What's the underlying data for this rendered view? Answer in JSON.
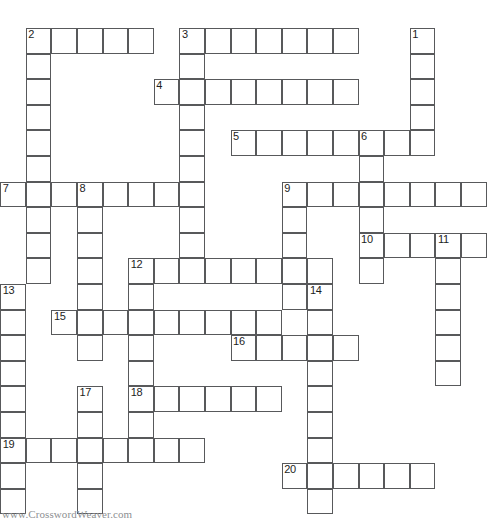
{
  "puzzle": {
    "title": "Crossword Puzzle Grid",
    "watermark": "www.CrosswordWeaver.com",
    "cell_size": 25.6,
    "origin_x": 0.2,
    "origin_y": 28.0,
    "colors": {
      "cell_border": "#58595b",
      "cell_fill": "#ffffff",
      "number_text": "#1d1d1d",
      "watermark_text": "#8d8f92",
      "page_background": "#ffffff"
    },
    "entries": [
      {
        "number": "1",
        "direction": "down",
        "row": 0,
        "col": 16,
        "length": 6
      },
      {
        "number": "2",
        "direction": "across",
        "row": 0,
        "col": 1,
        "length": 5
      },
      {
        "number": "2",
        "direction": "down",
        "row": 0,
        "col": 1,
        "length": 9
      },
      {
        "number": "3",
        "direction": "across",
        "row": 0,
        "col": 7,
        "length": 7
      },
      {
        "number": "3",
        "direction": "down",
        "row": 0,
        "col": 7,
        "length": 9
      },
      {
        "number": "4",
        "direction": "across",
        "row": 2,
        "col": 6,
        "length": 8
      },
      {
        "number": "5",
        "direction": "across",
        "row": 4,
        "col": 9,
        "length": 8
      },
      {
        "number": "6",
        "direction": "down",
        "row": 4,
        "col": 14,
        "length": 7
      },
      {
        "number": "7",
        "direction": "across",
        "row": 6,
        "col": 0,
        "length": 8
      },
      {
        "number": "8",
        "direction": "down",
        "row": 6,
        "col": 3,
        "length": 6
      },
      {
        "number": "9",
        "direction": "across",
        "row": 6,
        "col": 11,
        "length": 8
      },
      {
        "number": "9",
        "direction": "down",
        "row": 6,
        "col": 11,
        "length": 6
      },
      {
        "number": "10",
        "direction": "across",
        "row": 8,
        "col": 14,
        "length": 5
      },
      {
        "number": "11",
        "direction": "down",
        "row": 8,
        "col": 17,
        "length": 6
      },
      {
        "number": "12",
        "direction": "across",
        "row": 9,
        "col": 5,
        "length": 8
      },
      {
        "number": "12",
        "direction": "down",
        "row": 9,
        "col": 5,
        "length": 7
      },
      {
        "number": "13",
        "direction": "down",
        "row": 10,
        "col": 0,
        "length": 9
      },
      {
        "number": "14",
        "direction": "down",
        "row": 10,
        "col": 12,
        "length": 9
      },
      {
        "number": "15",
        "direction": "across",
        "row": 11,
        "col": 2,
        "length": 9
      },
      {
        "number": "16",
        "direction": "across",
        "row": 12,
        "col": 9,
        "length": 5
      },
      {
        "number": "17",
        "direction": "down",
        "row": 14,
        "col": 3,
        "length": 6
      },
      {
        "number": "18",
        "direction": "across",
        "row": 14,
        "col": 5,
        "length": 6
      },
      {
        "number": "19",
        "direction": "across",
        "row": 16,
        "col": 0,
        "length": 8
      },
      {
        "number": "20",
        "direction": "across",
        "row": 17,
        "col": 11,
        "length": 6
      }
    ],
    "cells": [
      {
        "r": 0,
        "c": 1,
        "n": "2"
      },
      {
        "r": 0,
        "c": 2,
        "n": ""
      },
      {
        "r": 0,
        "c": 3,
        "n": ""
      },
      {
        "r": 0,
        "c": 4,
        "n": ""
      },
      {
        "r": 0,
        "c": 5,
        "n": ""
      },
      {
        "r": 0,
        "c": 7,
        "n": "3"
      },
      {
        "r": 0,
        "c": 8,
        "n": ""
      },
      {
        "r": 0,
        "c": 9,
        "n": ""
      },
      {
        "r": 0,
        "c": 10,
        "n": ""
      },
      {
        "r": 0,
        "c": 11,
        "n": ""
      },
      {
        "r": 0,
        "c": 12,
        "n": ""
      },
      {
        "r": 0,
        "c": 13,
        "n": ""
      },
      {
        "r": 0,
        "c": 16,
        "n": "1"
      },
      {
        "r": 1,
        "c": 1,
        "n": ""
      },
      {
        "r": 1,
        "c": 7,
        "n": ""
      },
      {
        "r": 1,
        "c": 16,
        "n": ""
      },
      {
        "r": 2,
        "c": 1,
        "n": ""
      },
      {
        "r": 2,
        "c": 6,
        "n": "4"
      },
      {
        "r": 2,
        "c": 7,
        "n": ""
      },
      {
        "r": 2,
        "c": 8,
        "n": ""
      },
      {
        "r": 2,
        "c": 9,
        "n": ""
      },
      {
        "r": 2,
        "c": 10,
        "n": ""
      },
      {
        "r": 2,
        "c": 11,
        "n": ""
      },
      {
        "r": 2,
        "c": 12,
        "n": ""
      },
      {
        "r": 2,
        "c": 13,
        "n": ""
      },
      {
        "r": 2,
        "c": 16,
        "n": ""
      },
      {
        "r": 3,
        "c": 1,
        "n": ""
      },
      {
        "r": 3,
        "c": 7,
        "n": ""
      },
      {
        "r": 3,
        "c": 16,
        "n": ""
      },
      {
        "r": 4,
        "c": 1,
        "n": ""
      },
      {
        "r": 4,
        "c": 7,
        "n": ""
      },
      {
        "r": 4,
        "c": 9,
        "n": "5"
      },
      {
        "r": 4,
        "c": 10,
        "n": ""
      },
      {
        "r": 4,
        "c": 11,
        "n": ""
      },
      {
        "r": 4,
        "c": 12,
        "n": ""
      },
      {
        "r": 4,
        "c": 13,
        "n": ""
      },
      {
        "r": 4,
        "c": 14,
        "n": "6"
      },
      {
        "r": 4,
        "c": 15,
        "n": ""
      },
      {
        "r": 4,
        "c": 16,
        "n": ""
      },
      {
        "r": 5,
        "c": 1,
        "n": ""
      },
      {
        "r": 5,
        "c": 7,
        "n": ""
      },
      {
        "r": 5,
        "c": 14,
        "n": ""
      },
      {
        "r": 6,
        "c": 0,
        "n": "7"
      },
      {
        "r": 6,
        "c": 1,
        "n": ""
      },
      {
        "r": 6,
        "c": 2,
        "n": ""
      },
      {
        "r": 6,
        "c": 3,
        "n": "8"
      },
      {
        "r": 6,
        "c": 4,
        "n": ""
      },
      {
        "r": 6,
        "c": 5,
        "n": ""
      },
      {
        "r": 6,
        "c": 6,
        "n": ""
      },
      {
        "r": 6,
        "c": 7,
        "n": ""
      },
      {
        "r": 6,
        "c": 11,
        "n": "9"
      },
      {
        "r": 6,
        "c": 12,
        "n": ""
      },
      {
        "r": 6,
        "c": 13,
        "n": ""
      },
      {
        "r": 6,
        "c": 14,
        "n": ""
      },
      {
        "r": 6,
        "c": 15,
        "n": ""
      },
      {
        "r": 6,
        "c": 16,
        "n": ""
      },
      {
        "r": 6,
        "c": 17,
        "n": ""
      },
      {
        "r": 6,
        "c": 18,
        "n": ""
      },
      {
        "r": 7,
        "c": 1,
        "n": ""
      },
      {
        "r": 7,
        "c": 3,
        "n": ""
      },
      {
        "r": 7,
        "c": 7,
        "n": ""
      },
      {
        "r": 7,
        "c": 11,
        "n": ""
      },
      {
        "r": 7,
        "c": 14,
        "n": ""
      },
      {
        "r": 8,
        "c": 1,
        "n": ""
      },
      {
        "r": 8,
        "c": 3,
        "n": ""
      },
      {
        "r": 8,
        "c": 7,
        "n": ""
      },
      {
        "r": 8,
        "c": 11,
        "n": ""
      },
      {
        "r": 8,
        "c": 14,
        "n": "10"
      },
      {
        "r": 8,
        "c": 15,
        "n": ""
      },
      {
        "r": 8,
        "c": 16,
        "n": ""
      },
      {
        "r": 8,
        "c": 17,
        "n": "11"
      },
      {
        "r": 8,
        "c": 18,
        "n": ""
      },
      {
        "r": 9,
        "c": 1,
        "n": ""
      },
      {
        "r": 9,
        "c": 3,
        "n": ""
      },
      {
        "r": 9,
        "c": 5,
        "n": "12"
      },
      {
        "r": 9,
        "c": 6,
        "n": ""
      },
      {
        "r": 9,
        "c": 7,
        "n": ""
      },
      {
        "r": 9,
        "c": 8,
        "n": ""
      },
      {
        "r": 9,
        "c": 9,
        "n": ""
      },
      {
        "r": 9,
        "c": 10,
        "n": ""
      },
      {
        "r": 9,
        "c": 11,
        "n": ""
      },
      {
        "r": 9,
        "c": 12,
        "n": ""
      },
      {
        "r": 9,
        "c": 14,
        "n": ""
      },
      {
        "r": 9,
        "c": 17,
        "n": ""
      },
      {
        "r": 10,
        "c": 0,
        "n": "13"
      },
      {
        "r": 10,
        "c": 3,
        "n": ""
      },
      {
        "r": 10,
        "c": 5,
        "n": ""
      },
      {
        "r": 10,
        "c": 11,
        "n": ""
      },
      {
        "r": 10,
        "c": 12,
        "n": "14"
      },
      {
        "r": 10,
        "c": 17,
        "n": ""
      },
      {
        "r": 11,
        "c": 0,
        "n": ""
      },
      {
        "r": 11,
        "c": 2,
        "n": "15"
      },
      {
        "r": 11,
        "c": 3,
        "n": ""
      },
      {
        "r": 11,
        "c": 4,
        "n": ""
      },
      {
        "r": 11,
        "c": 5,
        "n": ""
      },
      {
        "r": 11,
        "c": 6,
        "n": ""
      },
      {
        "r": 11,
        "c": 7,
        "n": ""
      },
      {
        "r": 11,
        "c": 8,
        "n": ""
      },
      {
        "r": 11,
        "c": 9,
        "n": ""
      },
      {
        "r": 11,
        "c": 10,
        "n": ""
      },
      {
        "r": 11,
        "c": 12,
        "n": ""
      },
      {
        "r": 11,
        "c": 17,
        "n": ""
      },
      {
        "r": 12,
        "c": 0,
        "n": ""
      },
      {
        "r": 12,
        "c": 3,
        "n": ""
      },
      {
        "r": 12,
        "c": 5,
        "n": ""
      },
      {
        "r": 12,
        "c": 9,
        "n": "16"
      },
      {
        "r": 12,
        "c": 10,
        "n": ""
      },
      {
        "r": 12,
        "c": 11,
        "n": ""
      },
      {
        "r": 12,
        "c": 12,
        "n": ""
      },
      {
        "r": 12,
        "c": 13,
        "n": ""
      },
      {
        "r": 12,
        "c": 17,
        "n": ""
      },
      {
        "r": 13,
        "c": 0,
        "n": ""
      },
      {
        "r": 13,
        "c": 5,
        "n": ""
      },
      {
        "r": 13,
        "c": 12,
        "n": ""
      },
      {
        "r": 13,
        "c": 17,
        "n": ""
      },
      {
        "r": 14,
        "c": 0,
        "n": ""
      },
      {
        "r": 14,
        "c": 3,
        "n": "17"
      },
      {
        "r": 14,
        "c": 5,
        "n": "18"
      },
      {
        "r": 14,
        "c": 6,
        "n": ""
      },
      {
        "r": 14,
        "c": 7,
        "n": ""
      },
      {
        "r": 14,
        "c": 8,
        "n": ""
      },
      {
        "r": 14,
        "c": 9,
        "n": ""
      },
      {
        "r": 14,
        "c": 10,
        "n": ""
      },
      {
        "r": 14,
        "c": 12,
        "n": ""
      },
      {
        "r": 15,
        "c": 0,
        "n": ""
      },
      {
        "r": 15,
        "c": 3,
        "n": ""
      },
      {
        "r": 15,
        "c": 5,
        "n": ""
      },
      {
        "r": 15,
        "c": 12,
        "n": ""
      },
      {
        "r": 16,
        "c": 0,
        "n": "19"
      },
      {
        "r": 16,
        "c": 1,
        "n": ""
      },
      {
        "r": 16,
        "c": 2,
        "n": ""
      },
      {
        "r": 16,
        "c": 3,
        "n": ""
      },
      {
        "r": 16,
        "c": 4,
        "n": ""
      },
      {
        "r": 16,
        "c": 5,
        "n": ""
      },
      {
        "r": 16,
        "c": 6,
        "n": ""
      },
      {
        "r": 16,
        "c": 7,
        "n": ""
      },
      {
        "r": 16,
        "c": 12,
        "n": ""
      },
      {
        "r": 17,
        "c": 0,
        "n": ""
      },
      {
        "r": 17,
        "c": 3,
        "n": ""
      },
      {
        "r": 17,
        "c": 11,
        "n": "20"
      },
      {
        "r": 17,
        "c": 12,
        "n": ""
      },
      {
        "r": 17,
        "c": 13,
        "n": ""
      },
      {
        "r": 17,
        "c": 14,
        "n": ""
      },
      {
        "r": 17,
        "c": 15,
        "n": ""
      },
      {
        "r": 17,
        "c": 16,
        "n": ""
      },
      {
        "r": 18,
        "c": 0,
        "n": ""
      },
      {
        "r": 18,
        "c": 3,
        "n": ""
      },
      {
        "r": 18,
        "c": 12,
        "n": ""
      }
    ]
  }
}
